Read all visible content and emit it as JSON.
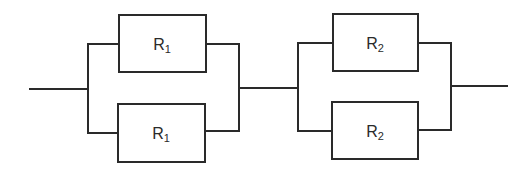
{
  "diagram": {
    "type": "circuit",
    "colors": {
      "line": "#2a2a2a",
      "background": "#ffffff"
    },
    "groups": [
      {
        "name": "group-1",
        "resistors": [
          {
            "position": "top",
            "label": {
              "base": "R",
              "sub": "1"
            }
          },
          {
            "position": "bottom",
            "label": {
              "base": "R",
              "sub": "1"
            }
          }
        ]
      },
      {
        "name": "group-2",
        "resistors": [
          {
            "position": "top",
            "label": {
              "base": "R",
              "sub": "2"
            }
          },
          {
            "position": "bottom",
            "label": {
              "base": "R",
              "sub": "2"
            }
          }
        ]
      }
    ]
  }
}
